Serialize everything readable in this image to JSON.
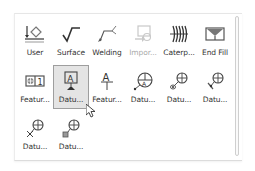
{
  "palette": {
    "items": [
      {
        "label": "User",
        "icon": "user-symbol-icon",
        "state": "normal"
      },
      {
        "label": "Surface",
        "icon": "surface-finish-icon",
        "state": "normal"
      },
      {
        "label": "Welding",
        "icon": "welding-symbol-icon",
        "state": "normal"
      },
      {
        "label": "Impor...",
        "icon": "import-icon",
        "state": "disabled"
      },
      {
        "label": "Caterp...",
        "icon": "caterpillar-icon",
        "state": "normal"
      },
      {
        "label": "End Fill",
        "icon": "end-fill-icon",
        "state": "normal"
      },
      {
        "label": "Featur...",
        "icon": "feature-control-frame-icon",
        "state": "normal"
      },
      {
        "label": "Datu...",
        "icon": "datum-feature-icon",
        "state": "selected"
      },
      {
        "label": "Featur...",
        "icon": "feature-identifier-icon",
        "state": "normal"
      },
      {
        "label": "Datu...",
        "icon": "datum-target-icon",
        "state": "normal"
      },
      {
        "label": "Datu...",
        "icon": "datum-target-circle-leader-icon",
        "state": "normal"
      },
      {
        "label": "Datu...",
        "icon": "datum-target-line-leader-icon",
        "state": "normal"
      },
      {
        "label": "Datu...",
        "icon": "datum-target-point-icon",
        "state": "normal"
      },
      {
        "label": "Datu...",
        "icon": "datum-target-square-icon",
        "state": "normal"
      }
    ]
  },
  "colors": {
    "icon_dark": "#333333",
    "icon_gray": "#777777",
    "selected_bg": "#e4e4e4",
    "selected_border": "#9e9e9e",
    "disabled": "#aaaaaa"
  }
}
